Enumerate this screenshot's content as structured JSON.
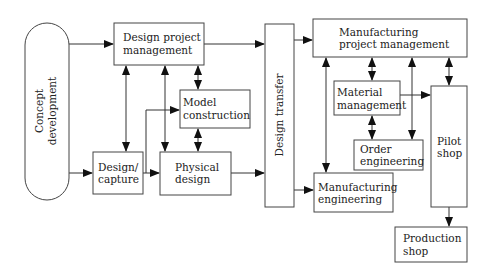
{
  "diagram": {
    "nodes": {
      "concept": {
        "line1": "Concept",
        "line2": "development"
      },
      "dpm": {
        "line1": "Design project",
        "line2": "management"
      },
      "model": {
        "line1": "Model",
        "line2": "construction"
      },
      "capture": {
        "line1": "Design/",
        "line2": "capture"
      },
      "physical": {
        "line1": "Physical",
        "line2": "design"
      },
      "transfer": {
        "line1": "Design transfer"
      },
      "mpm": {
        "line1": "Manufacturing",
        "line2": "project management"
      },
      "material": {
        "line1": "Material",
        "line2": "management"
      },
      "order": {
        "line1": "Order",
        "line2": "engineering"
      },
      "pilot": {
        "line1": "Pilot",
        "line2": "shop"
      },
      "mfgeng": {
        "line1": "Manufacturing",
        "line2": "engineering"
      },
      "production": {
        "line1": "Production",
        "line2": "shop"
      }
    },
    "edges": [
      {
        "from": "Concept development",
        "to": "Design project management",
        "type": "arrow"
      },
      {
        "from": "Concept development",
        "to": "Design/capture",
        "type": "arrow"
      },
      {
        "from": "Design project management",
        "to": "Design/capture",
        "type": "bidirectional"
      },
      {
        "from": "Design project management",
        "to": "Physical design",
        "type": "bidirectional"
      },
      {
        "from": "Design project management",
        "to": "Model construction",
        "type": "bidirectional"
      },
      {
        "from": "Design/capture",
        "to": "Model construction",
        "type": "arrow"
      },
      {
        "from": "Design/capture",
        "to": "Physical design",
        "type": "arrow"
      },
      {
        "from": "Model construction",
        "to": "Physical design",
        "type": "bidirectional"
      },
      {
        "from": "Design project management",
        "to": "Design transfer",
        "type": "arrow"
      },
      {
        "from": "Physical design",
        "to": "Design transfer",
        "type": "arrow"
      },
      {
        "from": "Design transfer",
        "to": "Manufacturing project management",
        "type": "arrow"
      },
      {
        "from": "Design transfer",
        "to": "Manufacturing engineering",
        "type": "arrow"
      },
      {
        "from": "Manufacturing project management",
        "to": "Manufacturing engineering",
        "type": "bidirectional"
      },
      {
        "from": "Manufacturing project management",
        "to": "Material management",
        "type": "bidirectional"
      },
      {
        "from": "Manufacturing project management",
        "to": "Order engineering",
        "type": "bidirectional"
      },
      {
        "from": "Manufacturing project management",
        "to": "Pilot shop",
        "type": "bidirectional"
      },
      {
        "from": "Material management",
        "to": "Pilot shop",
        "type": "arrow"
      },
      {
        "from": "Material management",
        "to": "Order engineering",
        "type": "bidirectional"
      },
      {
        "from": "Pilot shop",
        "to": "Production shop",
        "type": "arrow"
      }
    ]
  }
}
